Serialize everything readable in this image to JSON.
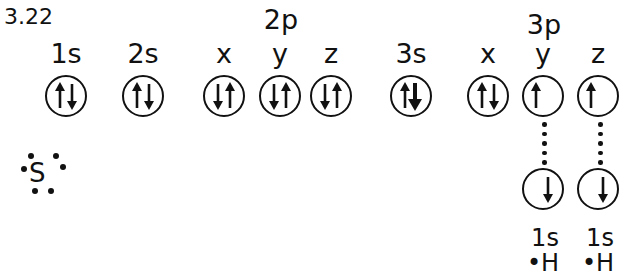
{
  "figure_number": "3.22",
  "group_labels": {
    "two_p": "2p",
    "three_p": "3p"
  },
  "orbitals": [
    {
      "label": "1s",
      "x": 66,
      "spin": "up-down"
    },
    {
      "label": "2s",
      "x": 143,
      "spin": "up-down"
    },
    {
      "label": "x",
      "x": 224,
      "spin": "down-up"
    },
    {
      "label": "y",
      "x": 280,
      "spin": "down-up"
    },
    {
      "label": "z",
      "x": 331,
      "spin": "down-up"
    },
    {
      "label": "3s",
      "x": 411,
      "spin": "up-down"
    },
    {
      "label": "x",
      "x": 488,
      "spin": "up-down"
    },
    {
      "label": "y",
      "x": 543,
      "spin": "up"
    },
    {
      "label": "z",
      "x": 598,
      "spin": "up"
    }
  ],
  "hydrogen_orbitals": [
    {
      "label": "1s",
      "atom": "•H",
      "x": 543,
      "spin": "down"
    },
    {
      "label": "1s",
      "atom": "•H",
      "x": 598,
      "spin": "down"
    }
  ],
  "lewis_symbol": {
    "element": "S",
    "valence_electrons": 6
  }
}
